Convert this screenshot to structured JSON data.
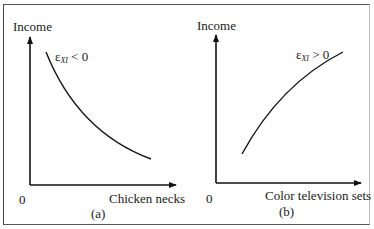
{
  "figure": {
    "panels": [
      {
        "id": "a",
        "caption": "(a)",
        "y_label": "Income",
        "x_label": "Chicken necks",
        "origin": "0",
        "curve_label": {
          "symbol": "ε",
          "subscript": "XI",
          "relation": "< 0"
        },
        "curve_shape": "downward-sloping convex"
      },
      {
        "id": "b",
        "caption": "(b)",
        "y_label": "Income",
        "x_label": "Color television sets",
        "origin": "0",
        "curve_label": {
          "symbol": "ε",
          "subscript": "XI",
          "relation": "> 0"
        },
        "curve_shape": "upward-sloping concave"
      }
    ]
  }
}
